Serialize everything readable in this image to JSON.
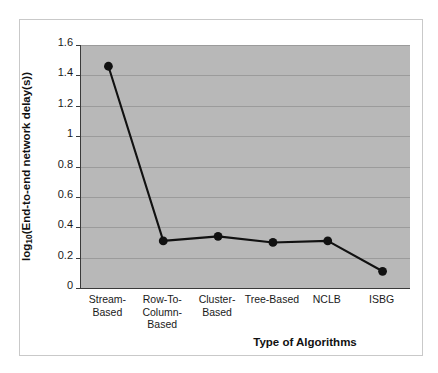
{
  "chart_data": {
    "type": "line",
    "title": "",
    "xlabel": "Type of Algorithms",
    "ylabel": "log10(End-to-end network delay(s))",
    "ylabel_prefix": "log",
    "ylabel_sub": "10",
    "ylabel_suffix": "(End-to-end network delay(s))",
    "categories": [
      "Stream-\nBased",
      "Row-To-\nColumn-\nBased",
      "Cluster-\nBased",
      "Tree-Based",
      "NCLB",
      "ISBG"
    ],
    "values": [
      1.46,
      0.31,
      0.34,
      0.3,
      0.31,
      0.11
    ],
    "ylim": [
      0,
      1.6
    ],
    "ytick_labels": [
      "1.6",
      "1.4",
      "1.2",
      "1",
      "0.8",
      "0.6",
      "0.4",
      "0.2",
      "0"
    ],
    "ytick_values": [
      1.6,
      1.4,
      1.2,
      1.0,
      0.8,
      0.6,
      0.4,
      0.2,
      0
    ],
    "grid": true,
    "legend": null,
    "series_color": "#111111",
    "marker": "circle",
    "marker_color": "#111111",
    "plot_background": "#b8b8b8",
    "figure_background": "#ffffff"
  }
}
